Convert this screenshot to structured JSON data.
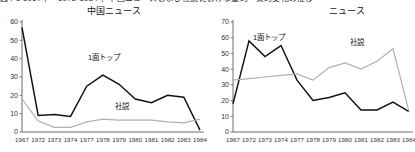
{
  "figure": {
    "caption_top": "図4-1  1967年・1972-1984年 中国ニュースおよび社説における量的・質的変化の推移"
  },
  "chart_data": [
    {
      "type": "line",
      "title": "中国ニュース",
      "panel": "left",
      "xlabel": "",
      "ylabel": "",
      "x": [
        "1967",
        "1972",
        "1973",
        "1974",
        "1977",
        "1978",
        "1979",
        "1980",
        "1981",
        "1982",
        "1983",
        "1984"
      ],
      "ylim": [
        0,
        60
      ],
      "yticks": [
        0,
        10,
        20,
        30,
        40,
        50,
        60
      ],
      "grid": false,
      "legend": "inline-annotation",
      "series": [
        {
          "name": "1面トップ",
          "color": "#111111",
          "values": [
            57,
            9,
            9.5,
            8.5,
            25,
            31,
            26,
            18,
            16,
            20,
            19,
            1
          ]
        },
        {
          "name": "社説",
          "color": "#b0b0b0",
          "values": [
            18,
            6,
            2.5,
            2.5,
            5.5,
            7,
            6.5,
            6.5,
            6.5,
            5.5,
            5,
            7
          ]
        }
      ]
    },
    {
      "type": "line",
      "title": "ニュース",
      "panel": "right",
      "xlabel": "",
      "ylabel": "",
      "x": [
        "1967",
        "1972",
        "1973",
        "1974",
        "1977",
        "1978",
        "1979",
        "1980",
        "1981",
        "1982",
        "1983",
        "1984"
      ],
      "ylim": [
        0,
        70
      ],
      "yticks": [
        0,
        10,
        20,
        30,
        40,
        50,
        60,
        70
      ],
      "grid": false,
      "legend": "inline-annotation",
      "series": [
        {
          "name": "1面トップ",
          "color": "#111111",
          "values": [
            18,
            58,
            48,
            55,
            33,
            20,
            22,
            25,
            14,
            14,
            19,
            13
          ]
        },
        {
          "name": "社説",
          "color": "#b0b0b0",
          "values": [
            33,
            34,
            35,
            36,
            37,
            33,
            41,
            44,
            40,
            45,
            53,
            13
          ]
        }
      ]
    }
  ]
}
